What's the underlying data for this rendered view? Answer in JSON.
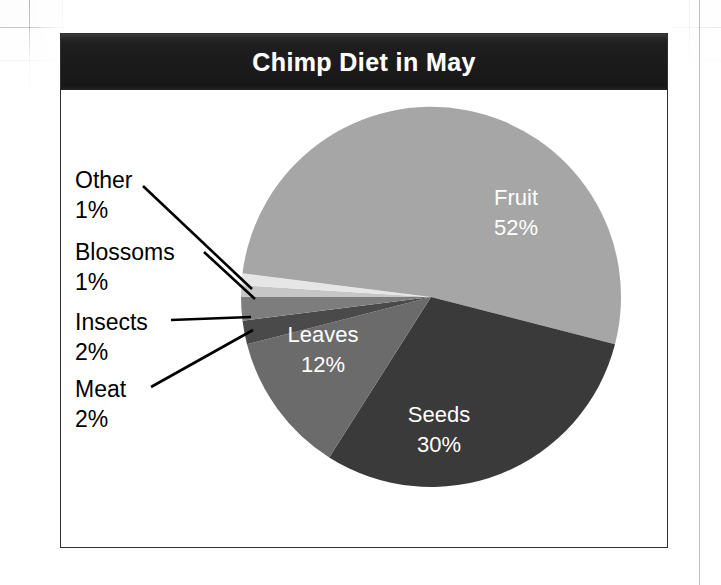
{
  "chart_frame": {
    "title": "Chimp Diet in May"
  },
  "chart_data": {
    "type": "pie",
    "title": "Chimp Diet in May",
    "xlabel": "",
    "ylabel": "",
    "grid": false,
    "legend": "none",
    "label_format": "name + percent",
    "categories": [
      "Fruit",
      "Seeds",
      "Leaves",
      "Meat",
      "Insects",
      "Blossoms",
      "Other"
    ],
    "values": [
      52,
      30,
      12,
      2,
      2,
      1,
      1
    ],
    "units": "percent",
    "total": 100,
    "slices": [
      {
        "name": "Fruit",
        "value": 52,
        "label": "Fruit",
        "percent_label": "52%",
        "color": "#a6a6a6",
        "label_placement": "inside",
        "text_color": "#ffffff"
      },
      {
        "name": "Seeds",
        "value": 30,
        "label": "Seeds",
        "percent_label": "30%",
        "color": "#3a3a3a",
        "label_placement": "inside",
        "text_color": "#ffffff"
      },
      {
        "name": "Leaves",
        "value": 12,
        "label": "Leaves",
        "percent_label": "12%",
        "color": "#6b6b6b",
        "label_placement": "inside",
        "text_color": "#ffffff"
      },
      {
        "name": "Meat",
        "value": 2,
        "label": "Meat",
        "percent_label": "2%",
        "color": "#4a4a4a",
        "label_placement": "outside",
        "text_color": "#000000"
      },
      {
        "name": "Insects",
        "value": 2,
        "label": "Insects",
        "percent_label": "2%",
        "color": "#7d7d7d",
        "label_placement": "outside",
        "text_color": "#000000"
      },
      {
        "name": "Blossoms",
        "value": 1,
        "label": "Blossoms",
        "percent_label": "1%",
        "color": "#e6e6e6",
        "label_placement": "outside",
        "text_color": "#000000"
      },
      {
        "name": "Other",
        "value": 1,
        "label": "Other",
        "percent_label": "1%",
        "color": "#c6c6c6",
        "label_placement": "outside",
        "text_color": "#000000"
      }
    ]
  },
  "callouts": [
    {
      "name": "Other",
      "percent": "1%"
    },
    {
      "name": "Blossoms",
      "percent": "1%"
    },
    {
      "name": "Insects",
      "percent": "2%"
    },
    {
      "name": "Meat",
      "percent": "2%"
    }
  ],
  "inside_labels": [
    {
      "name": "Fruit",
      "percent": "52%"
    },
    {
      "name": "Leaves",
      "percent": "12%"
    },
    {
      "name": "Seeds",
      "percent": "30%"
    }
  ],
  "colors": {
    "title_bar": "#1e1e1e",
    "title_text": "#ffffff",
    "frame_border": "#303030",
    "plot_background": "#ffffff",
    "page_background": "#ffffff",
    "leader_line": "#000000"
  }
}
